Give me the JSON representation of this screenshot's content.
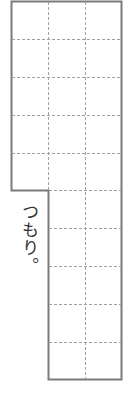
{
  "worksheet": {
    "answer_text": "つもり。",
    "grid": {
      "columns_upper": 3,
      "columns_lower": 2,
      "rows_upper": 5,
      "rows_lower": 5,
      "border_color": "#7a7a7a",
      "dash_color": "#a0a0a0"
    }
  }
}
